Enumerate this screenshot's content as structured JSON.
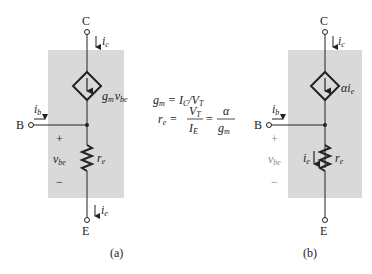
{
  "diagram": {
    "type": "small-signal transistor model (T-model)",
    "colors": {
      "box": "#d9d9d9",
      "wire": "#222222",
      "background": "#ffffff"
    },
    "panel_a": {
      "caption": "(a)",
      "terminals": {
        "collector": "C",
        "base": "B",
        "emitter": "E"
      },
      "currents": {
        "collector": "i",
        "collector_sub": "c",
        "base": "i",
        "base_sub": "b",
        "emitter": "i",
        "emitter_sub": "e"
      },
      "source": {
        "label": "g",
        "label_sub": "m",
        "label2": "v",
        "label2_sub": "be"
      },
      "resistor": {
        "label": "r",
        "label_sub": "e"
      },
      "voltage": {
        "label": "v",
        "label_sub": "be",
        "plus": "+",
        "minus": "−"
      }
    },
    "equations": {
      "eq1_lhs": "g",
      "eq1_lhs_sub": "m",
      "eq1_rhs": "= I",
      "eq1_rhs_sub": "C",
      "eq1_rhs2": "/V",
      "eq1_rhs2_sub": "T",
      "eq2_lhs": "r",
      "eq2_lhs_sub": "e",
      "eq2_eq": "=",
      "eq2_num": "V",
      "eq2_num_sub": "T",
      "eq2_den": "I",
      "eq2_den_sub": "E",
      "eq2_eq2": "=",
      "eq2_num2": "α",
      "eq2_den2": "g",
      "eq2_den2_sub": "m"
    },
    "panel_b": {
      "caption": "(b)",
      "terminals": {
        "collector": "C",
        "base": "B",
        "emitter": "E"
      },
      "currents": {
        "collector": "i",
        "collector_sub": "c",
        "base": "i",
        "base_sub": "b",
        "emitter": "i",
        "emitter_sub": "e"
      },
      "source": {
        "label": "αi",
        "label_sub": "e"
      },
      "resistor": {
        "label": "r",
        "label_sub": "e"
      },
      "voltage": {
        "label": "v",
        "label_sub": "be",
        "plus": "+",
        "minus": "−"
      }
    }
  }
}
